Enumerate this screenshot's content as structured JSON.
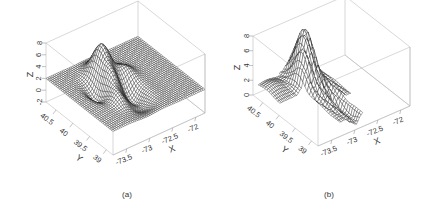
{
  "figure": {
    "panels": [
      {
        "id": "a",
        "caption": "(a)"
      },
      {
        "id": "b",
        "caption": "(b)"
      }
    ]
  },
  "chart_data": [
    {
      "type": "surface3d",
      "panel": "(a)",
      "title": "",
      "xlabel": "X",
      "ylabel": "Y",
      "zlabel": "Z",
      "x_ticks": [
        "-73.5",
        "-73",
        "-72.5",
        "-72"
      ],
      "y_ticks": [
        "40.5",
        "40",
        "39.5",
        "39"
      ],
      "z_ticks": [
        "-2",
        "0",
        "2",
        "4",
        "6",
        "8"
      ],
      "xlim": [
        -73.8,
        -71.8
      ],
      "ylim": [
        38.8,
        40.8
      ],
      "zlim": [
        -2,
        8
      ],
      "style": "smooth wireframe mesh",
      "description": "Smooth surface, mostly flat near z≈2, with a central peak reaching about z≈7.5 near x≈-73.0, y≈40.2 and surrounding ridges/troughs dipping toward z≈-1"
    },
    {
      "type": "surface3d",
      "panel": "(b)",
      "title": "",
      "xlabel": "X",
      "ylabel": "Y",
      "zlabel": "Z",
      "x_ticks": [
        "-73.5",
        "-73",
        "-72.5",
        "-72"
      ],
      "y_ticks": [
        "40.5",
        "40",
        "39.5",
        "39"
      ],
      "z_ticks": [
        "0",
        "2",
        "4",
        "6",
        "8"
      ],
      "xlim": [
        -73.8,
        -71.8
      ],
      "ylim": [
        38.8,
        40.8
      ],
      "zlim": [
        0,
        8
      ],
      "style": "jagged wireframe mesh (sparse data region only)",
      "description": "Irregular, spiky surface defined only over a narrow band; peaks near z≈7.5 around x≈-73.1, deep narrow spike down toward z≈0 near x≈-73.3"
    }
  ]
}
